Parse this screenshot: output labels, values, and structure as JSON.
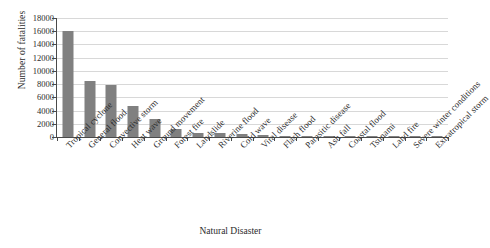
{
  "chart_data": {
    "type": "bar",
    "title": "",
    "xlabel": "Natural Disaster",
    "ylabel": "Number of fatalities",
    "ylim": [
      0,
      18000
    ],
    "ytick_step": 2000,
    "yticks": [
      18000,
      16000,
      14000,
      12000,
      10000,
      8000,
      6000,
      4000,
      2000,
      0
    ],
    "ytick_labels": [
      "18000",
      "16000",
      "14000",
      "12000",
      "10000",
      "8000",
      "6000",
      "4000",
      "2000",
      "0"
    ],
    "grid": "horizontal",
    "legend": "none",
    "bar_color": "#808080",
    "categories": [
      "Tropical cyclone",
      "General flood",
      "Convective storm",
      "Heat wave",
      "Ground movement",
      "Forest fire",
      "Landslide",
      "Riverine flood",
      "Cold wave",
      "Viral disease",
      "Flash flood",
      "Parasitic disease",
      "Ash fall",
      "Coastal flood",
      "Tsunami",
      "Land fire",
      "Severe winter conditions",
      "Extratropical storm"
    ],
    "values": [
      16000,
      8400,
      7850,
      4750,
      2800,
      1250,
      650,
      620,
      400,
      230,
      80,
      40,
      30,
      25,
      20,
      15,
      10,
      5
    ]
  }
}
